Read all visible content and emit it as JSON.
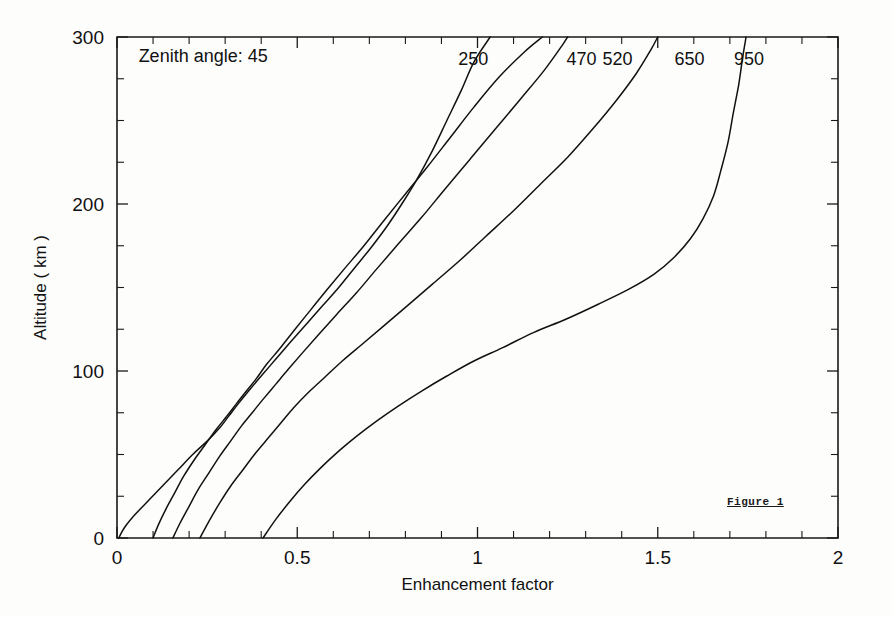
{
  "figure": {
    "caption": "Figure 1",
    "annotation": "Zenith angle: 45",
    "background_color": "#fdfdfc",
    "ink_color": "#111111"
  },
  "chart_data": {
    "type": "line",
    "title": "",
    "subtitle": "",
    "xlabel": "Enhancement factor",
    "ylabel": "Altitude ( km )",
    "xlim": [
      0,
      2
    ],
    "ylim": [
      0,
      300
    ],
    "xticks": [
      0,
      0.5,
      1,
      1.5,
      2
    ],
    "xticklabels": [
      "0",
      "0.5",
      "1",
      "1.5",
      "2"
    ],
    "yticks": [
      0,
      100,
      200,
      300
    ],
    "yticklabels": [
      "0",
      "100",
      "200",
      "300"
    ],
    "x_minor_step": 0.1,
    "y_minor_step": 25,
    "grid": false,
    "legend": "inline-curve-labels",
    "legend_position": "top-of-curves",
    "annotations": [
      {
        "text": "Zenith angle: 45",
        "x": 0.06,
        "y": 285
      },
      {
        "text": "Figure 1",
        "x": 1.72,
        "y": 40
      }
    ],
    "series": [
      {
        "name": "250",
        "label": "250",
        "label_x": 1.03,
        "label_y": 283,
        "points": [
          [
            0.005,
            0
          ],
          [
            0.02,
            6
          ],
          [
            0.05,
            14
          ],
          [
            0.09,
            23
          ],
          [
            0.13,
            32
          ],
          [
            0.17,
            41
          ],
          [
            0.21,
            50
          ],
          [
            0.25,
            58
          ],
          [
            0.285,
            66
          ],
          [
            0.31,
            73
          ],
          [
            0.335,
            80
          ],
          [
            0.365,
            88
          ],
          [
            0.4,
            97
          ],
          [
            0.44,
            107
          ],
          [
            0.48,
            117
          ],
          [
            0.525,
            128
          ],
          [
            0.57,
            139
          ],
          [
            0.615,
            150
          ],
          [
            0.66,
            162
          ],
          [
            0.705,
            174
          ],
          [
            0.75,
            187
          ],
          [
            0.79,
            200
          ],
          [
            0.83,
            214
          ],
          [
            0.875,
            232
          ],
          [
            0.915,
            250
          ],
          [
            0.955,
            268
          ],
          [
            0.99,
            285
          ],
          [
            1.035,
            300
          ]
        ]
      },
      {
        "name": "470",
        "label": "470",
        "label_x": 1.33,
        "label_y": 283,
        "points": [
          [
            0.1,
            0
          ],
          [
            0.115,
            8
          ],
          [
            0.135,
            17
          ],
          [
            0.16,
            27
          ],
          [
            0.185,
            37
          ],
          [
            0.215,
            47
          ],
          [
            0.245,
            56
          ],
          [
            0.275,
            65
          ],
          [
            0.305,
            73
          ],
          [
            0.33,
            80
          ],
          [
            0.355,
            87
          ],
          [
            0.385,
            95
          ],
          [
            0.415,
            104
          ],
          [
            0.45,
            113
          ],
          [
            0.49,
            124
          ],
          [
            0.535,
            136
          ],
          [
            0.58,
            148
          ],
          [
            0.63,
            161
          ],
          [
            0.685,
            175
          ],
          [
            0.74,
            190
          ],
          [
            0.8,
            206
          ],
          [
            0.86,
            222
          ],
          [
            0.925,
            240
          ],
          [
            0.99,
            258
          ],
          [
            1.06,
            276
          ],
          [
            1.13,
            291
          ],
          [
            1.18,
            300
          ]
        ]
      },
      {
        "name": "520",
        "label": "520",
        "label_x": 1.43,
        "label_y": 283,
        "points": [
          [
            0.155,
            0
          ],
          [
            0.175,
            9
          ],
          [
            0.2,
            19
          ],
          [
            0.225,
            29
          ],
          [
            0.255,
            39
          ],
          [
            0.285,
            49
          ],
          [
            0.315,
            58
          ],
          [
            0.345,
            67
          ],
          [
            0.375,
            75
          ],
          [
            0.405,
            83
          ],
          [
            0.44,
            92
          ],
          [
            0.475,
            101
          ],
          [
            0.515,
            111
          ],
          [
            0.56,
            122
          ],
          [
            0.61,
            134
          ],
          [
            0.665,
            147
          ],
          [
            0.72,
            161
          ],
          [
            0.78,
            176
          ],
          [
            0.845,
            192
          ],
          [
            0.91,
            209
          ],
          [
            0.98,
            227
          ],
          [
            1.05,
            245
          ],
          [
            1.12,
            263
          ],
          [
            1.185,
            280
          ],
          [
            1.235,
            295
          ],
          [
            1.25,
            300
          ]
        ]
      },
      {
        "name": "650",
        "label": "650",
        "label_x": 1.63,
        "label_y": 283,
        "points": [
          [
            0.23,
            0
          ],
          [
            0.255,
            10
          ],
          [
            0.285,
            21
          ],
          [
            0.315,
            31
          ],
          [
            0.35,
            41
          ],
          [
            0.385,
            51
          ],
          [
            0.42,
            60
          ],
          [
            0.455,
            69
          ],
          [
            0.49,
            78
          ],
          [
            0.53,
            87
          ],
          [
            0.575,
            96
          ],
          [
            0.625,
            106
          ],
          [
            0.68,
            116
          ],
          [
            0.74,
            127
          ],
          [
            0.805,
            139
          ],
          [
            0.875,
            152
          ],
          [
            0.95,
            166
          ],
          [
            1.025,
            181
          ],
          [
            1.1,
            196
          ],
          [
            1.175,
            212
          ],
          [
            1.25,
            228
          ],
          [
            1.32,
            245
          ],
          [
            1.385,
            262
          ],
          [
            1.44,
            278
          ],
          [
            1.48,
            292
          ],
          [
            1.5,
            300
          ]
        ]
      },
      {
        "name": "950",
        "label": "950",
        "label_x": 1.795,
        "label_y": 283,
        "points": [
          [
            0.405,
            0
          ],
          [
            0.44,
            11
          ],
          [
            0.48,
            22
          ],
          [
            0.52,
            32
          ],
          [
            0.565,
            42
          ],
          [
            0.615,
            52
          ],
          [
            0.665,
            61
          ],
          [
            0.72,
            70
          ],
          [
            0.78,
            79
          ],
          [
            0.845,
            88
          ],
          [
            0.915,
            97
          ],
          [
            0.99,
            106
          ],
          [
            1.07,
            114
          ],
          [
            1.155,
            123
          ],
          [
            1.245,
            131
          ],
          [
            1.335,
            140
          ],
          [
            1.42,
            149
          ],
          [
            1.49,
            158
          ],
          [
            1.545,
            168
          ],
          [
            1.59,
            179
          ],
          [
            1.625,
            191
          ],
          [
            1.655,
            205
          ],
          [
            1.675,
            220
          ],
          [
            1.695,
            237
          ],
          [
            1.71,
            255
          ],
          [
            1.725,
            272
          ],
          [
            1.735,
            287
          ],
          [
            1.745,
            300
          ]
        ]
      }
    ]
  }
}
